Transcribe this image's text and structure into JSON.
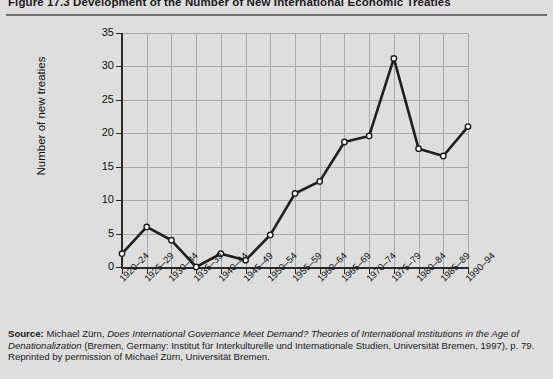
{
  "figure": {
    "number": "Figure 17.3",
    "title": "Development of the Number of New International Economic Treaties",
    "full_title": "Figure 17.3  Development of the Number of New International Economic Treaties"
  },
  "source": {
    "label": "Source:",
    "line1_plain_a": "Michael Zürn, ",
    "line1_italic": "Does International Governance Meet Demand? Theories of International Institutions in the Age of Denationalization",
    "line2_plain": " (Bremen, Germany: Institut für Interkulturelle und Internationale Studien, Universität Bremen, 1997), p. 79. Reprinted by permission of Michael Zürn, Universität Bremen."
  },
  "chart_data": {
    "type": "line",
    "title": "Development of the Number of New International Economic Treaties",
    "xlabel": "",
    "ylabel": "Number of new treaties",
    "ylim": [
      0,
      35
    ],
    "yticks": [
      0,
      5,
      10,
      15,
      20,
      25,
      30,
      35
    ],
    "grid": true,
    "legend": "none",
    "marker": "open-circle",
    "line_color": "#1f1f1f",
    "marker_face_color": "#ffffff",
    "categories": [
      "1920–24",
      "1925–29",
      "1930–34",
      "1935–39",
      "1940–44",
      "1945–49",
      "1950–54",
      "1955–59",
      "1960–64",
      "1965–69",
      "1970–74",
      "1975–79",
      "1980–84",
      "1985–89",
      "1990–94"
    ],
    "values": [
      2,
      6,
      4,
      0,
      2,
      1,
      4.8,
      11,
      12.8,
      18.7,
      19.6,
      31.2,
      17.7,
      16.6,
      21
    ]
  }
}
